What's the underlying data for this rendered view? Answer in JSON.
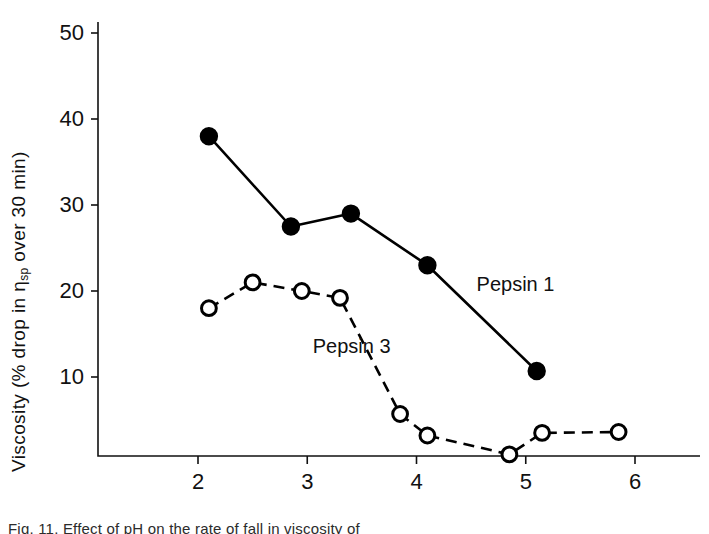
{
  "figure": {
    "y_axis_title_prefix": "Viscosity (% drop in ",
    "y_axis_symbol": "η",
    "y_axis_symbol_sub": "sp",
    "y_axis_title_suffix": " over 30 min)",
    "x_axis_title": "pH",
    "series_label_1": "Pepsin 1",
    "series_label_3": "Pepsin 3",
    "caption": "Fig. 11. Effect of pH on the rate of fall in viscosity of"
  },
  "chart_data": {
    "type": "line",
    "title": "",
    "xlabel": "pH",
    "ylabel": "Viscosity (% drop in ηsp over 30 min)",
    "xlim": [
      1.55,
      6.2
    ],
    "ylim": [
      0,
      50
    ],
    "xticks": [
      2,
      3,
      4,
      5,
      6
    ],
    "yticks": [
      10,
      20,
      30,
      40,
      50
    ],
    "grid": false,
    "legend": "inline-annotation",
    "series": [
      {
        "name": "Pepsin 1",
        "marker": "filled-circle",
        "line": "solid",
        "color": "#000000",
        "points": [
          {
            "x": 2.1,
            "y": 38.0
          },
          {
            "x": 2.85,
            "y": 27.5
          },
          {
            "x": 3.4,
            "y": 29.0
          },
          {
            "x": 4.1,
            "y": 23.0
          },
          {
            "x": 5.1,
            "y": 10.7
          }
        ]
      },
      {
        "name": "Pepsin 3",
        "marker": "open-circle",
        "line": "dashed",
        "color": "#000000",
        "points": [
          {
            "x": 2.1,
            "y": 18.0
          },
          {
            "x": 2.5,
            "y": 21.0
          },
          {
            "x": 2.95,
            "y": 20.0
          },
          {
            "x": 3.3,
            "y": 19.2
          },
          {
            "x": 3.85,
            "y": 5.7
          },
          {
            "x": 4.1,
            "y": 3.2
          },
          {
            "x": 4.85,
            "y": 1.0
          },
          {
            "x": 5.15,
            "y": 3.5
          },
          {
            "x": 5.85,
            "y": 3.6
          }
        ]
      }
    ],
    "annotations": [
      {
        "text": "Pepsin 1",
        "x": 4.55,
        "y": 20.0
      },
      {
        "text": "Pepsin 3",
        "x": 3.05,
        "y": 12.8
      }
    ]
  }
}
